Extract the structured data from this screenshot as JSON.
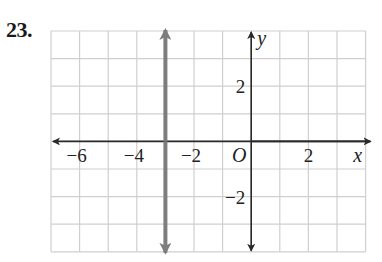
{
  "problem": {
    "number": "23."
  },
  "chart_data": {
    "type": "line",
    "title": "",
    "xlabel": "x",
    "ylabel": "y",
    "xlim": [
      -7,
      4
    ],
    "ylim": [
      -4,
      4
    ],
    "grid": true,
    "grid_step": 1,
    "origin_label": "O",
    "x_tick_labels": [
      {
        "value": -6,
        "label": "−6"
      },
      {
        "value": -4,
        "label": "−4"
      },
      {
        "value": -2,
        "label": "−2"
      },
      {
        "value": 2,
        "label": "2"
      }
    ],
    "y_tick_labels": [
      {
        "value": 2,
        "label": "2"
      },
      {
        "value": -2,
        "label": "−2"
      }
    ],
    "series": [
      {
        "name": "x = -3",
        "kind": "vertical_line",
        "x": -3,
        "points": [
          [
            -3,
            4
          ],
          [
            -3,
            -4
          ]
        ],
        "arrows": "both",
        "color": "#7d7d7d"
      }
    ],
    "legend": null
  },
  "colors": {
    "grid": "#cfcfcf",
    "axes": "#2a2a2a",
    "graph_line": "#7d7d7d"
  }
}
